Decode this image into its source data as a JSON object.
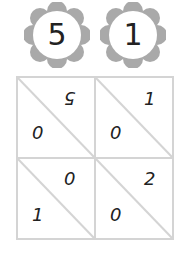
{
  "flowers": [
    {
      "value": "5"
    },
    {
      "value": "1"
    }
  ],
  "lattice": {
    "cells": [
      {
        "top": "5",
        "bottom": "0"
      },
      {
        "top": "1",
        "bottom": "0"
      },
      {
        "top": "0",
        "bottom": "1"
      },
      {
        "top": "2",
        "bottom": "0"
      }
    ]
  },
  "colors": {
    "petal": "#a9a9a9",
    "grid": "#d4d4d4"
  }
}
